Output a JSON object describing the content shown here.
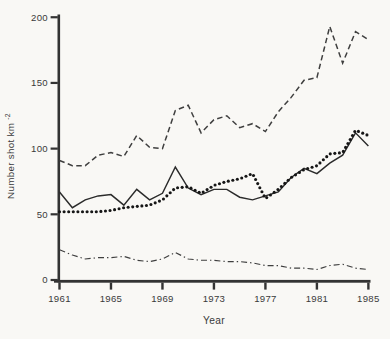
{
  "figure": {
    "kind": "scanned-line-chart",
    "background": "#f9f8f5",
    "ink": "#333333"
  },
  "chart_data": {
    "type": "line",
    "title": "",
    "xlabel": "Year",
    "ylabel": "Number shot km",
    "ylabel_superscript": "-2",
    "xlim": [
      1961,
      1985
    ],
    "ylim": [
      0,
      200
    ],
    "xticks": [
      1961,
      1965,
      1969,
      1973,
      1977,
      1981,
      1985
    ],
    "yticks": [
      0,
      50,
      100,
      150,
      200
    ],
    "grid": false,
    "legend": null,
    "x": [
      1961,
      1962,
      1963,
      1964,
      1965,
      1966,
      1967,
      1968,
      1969,
      1970,
      1971,
      1972,
      1973,
      1974,
      1975,
      1976,
      1977,
      1978,
      1979,
      1980,
      1981,
      1982,
      1983,
      1984,
      1985
    ],
    "series": [
      {
        "id": "dashed-line",
        "style": "dashed",
        "color": "#3f3f3f",
        "values": [
          91,
          87,
          87,
          95,
          97,
          94,
          110,
          101,
          100,
          129,
          133,
          112,
          122,
          125,
          116,
          119,
          113,
          128,
          139,
          152,
          154,
          193,
          165,
          189,
          183
        ]
      },
      {
        "id": "solid-line",
        "style": "solid",
        "color": "#2b2b2b",
        "values": [
          67,
          55,
          61,
          64,
          65,
          57,
          69,
          61,
          66,
          86,
          70,
          65,
          69,
          69,
          63,
          61,
          64,
          67,
          78,
          85,
          81,
          89,
          95,
          112,
          102
        ]
      },
      {
        "id": "bold-dotted-line",
        "style": "dotted",
        "color": "#161616",
        "values": [
          52,
          52,
          52,
          52,
          53,
          55,
          56,
          57,
          61,
          70,
          71,
          66,
          72,
          75,
          77,
          81,
          62,
          69,
          78,
          84,
          87,
          96,
          97,
          114,
          110
        ]
      },
      {
        "id": "dash-dot-line",
        "style": "dashdot",
        "color": "#3f3f3f",
        "values": [
          23,
          19,
          16,
          17,
          17,
          18,
          15,
          14,
          16,
          21,
          16,
          15,
          15,
          14,
          14,
          13,
          11,
          11,
          9,
          9,
          8,
          11,
          12,
          9,
          8
        ]
      }
    ]
  }
}
